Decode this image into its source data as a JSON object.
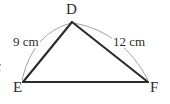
{
  "diagram": {
    "type": "triangle-with-arc-measures",
    "shape_name": "triangle-DEF",
    "background_color": "#ffffff",
    "stroke_color": "#2b2b2b",
    "arc_color": "#9a9a9a",
    "vertices": [
      {
        "id": "D",
        "label": "D",
        "x": 72,
        "y": 22
      },
      {
        "id": "E",
        "label": "E",
        "x": 23,
        "y": 82
      },
      {
        "id": "F",
        "label": "F",
        "x": 148,
        "y": 82
      }
    ],
    "edges": [
      {
        "id": "DE",
        "from": "D",
        "to": "E"
      },
      {
        "id": "DF",
        "from": "D",
        "to": "F"
      },
      {
        "id": "EF",
        "from": "E",
        "to": "F"
      }
    ],
    "measures": [
      {
        "id": "DE",
        "value": "9",
        "unit": "cm",
        "label": "9 cm"
      },
      {
        "id": "DF",
        "value": "12",
        "unit": "cm",
        "label": "12 cm"
      }
    ],
    "arcs": [
      {
        "id": "arc-DE",
        "from": "D",
        "to": "E",
        "bulge": "outward-left"
      },
      {
        "id": "arc-DF",
        "from": "D",
        "to": "F",
        "bulge": "outward-right"
      }
    ],
    "clipped_edge_glyph": "c"
  }
}
